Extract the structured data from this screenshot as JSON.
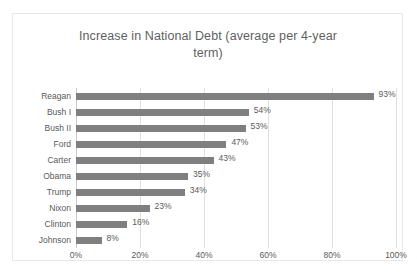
{
  "chart_data": {
    "type": "bar",
    "orientation": "horizontal",
    "title": "Increase in National Debt (average per 4-year term)",
    "title_line1": "Increase in National Debt (average per 4-year",
    "title_line2": "term)",
    "xlabel": "",
    "ylabel": "",
    "categories": [
      "Reagan",
      "Bush I",
      "Bush II",
      "Ford",
      "Carter",
      "Obama",
      "Trump",
      "Nixon",
      "Clinton",
      "Johnson"
    ],
    "values": [
      93,
      54,
      53,
      47,
      43,
      35,
      34,
      23,
      16,
      8
    ],
    "data_labels": [
      "93%",
      "54%",
      "53%",
      "47%",
      "43%",
      "35%",
      "34%",
      "23%",
      "16%",
      "8%"
    ],
    "xlim": [
      0,
      100
    ],
    "xticks": [
      0,
      20,
      40,
      60,
      80,
      100
    ],
    "xtick_labels": [
      "0%",
      "20%",
      "40%",
      "60%",
      "80%",
      "100%"
    ],
    "grid": "vertical",
    "legend": "none",
    "bar_color": "#7f7f7f",
    "text_color": "#5a5a5a",
    "title_color": "#5f5f5f",
    "gridline_color": "#e0e0e0",
    "border_color": "#e8e8e8",
    "background_color": "#ffffff"
  }
}
